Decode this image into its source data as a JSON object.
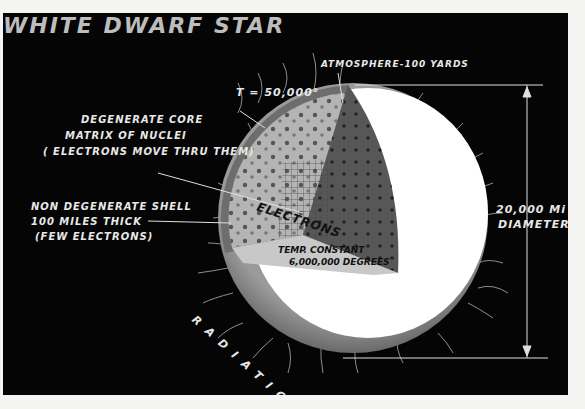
{
  "title": "WHITE DWARF STAR",
  "labels": {
    "temperature": "T = 50,000°",
    "atmosphere": "ATMOSPHERE-100 YARDS",
    "core_line1": "DEGENERATE CORE",
    "core_line2": "MATRIX OF NUCLEI",
    "core_line3": "( ELECTRONS MOVE THRU THEM)",
    "shell_line1": "NON DEGENERATE SHELL",
    "shell_line2": "100 MILES THICK",
    "shell_line3": "(FEW ELECTRONS)",
    "electrons": "ELECTRONS",
    "temp_constant_line1": "TEMP. CONSTANT",
    "temp_constant_line2": "6,000,000 DEGREES",
    "diameter_line1": "20,000 Mi",
    "diameter_line2": "DIAMETER",
    "radiation": "RADIATION"
  },
  "colors": {
    "background": "#050505",
    "border": "#f4f4f2",
    "sphere": "#ffffff",
    "rim": "#8a8a8a",
    "core_light": "#b8b8b8",
    "core_dark": "#5a5a5a",
    "text": "#e8e8e8",
    "title": "#bdbdbd"
  }
}
